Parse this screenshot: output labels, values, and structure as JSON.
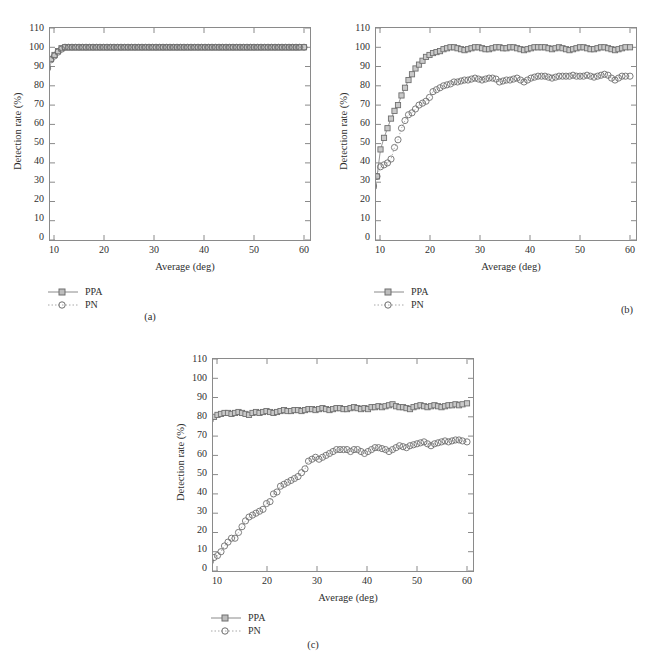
{
  "figure": {
    "background": "#ffffff",
    "line_color": "#8a8a8a",
    "text_color": "#2f2f2f"
  },
  "panels": [
    {
      "id": "a",
      "caption": "(a)",
      "axis": {
        "xlabel": "Average (deg)",
        "ylabel": "Detection rate (%)",
        "xticks": [
          "10",
          "20",
          "30",
          "40",
          "50",
          "60"
        ],
        "yticks": [
          "0",
          "10",
          "20",
          "30",
          "40",
          "50",
          "60",
          "70",
          "80",
          "90",
          "100",
          "110"
        ]
      },
      "legend": [
        {
          "label": "PPA",
          "marker": "square",
          "line": "solid"
        },
        {
          "label": "PN",
          "marker": "circle",
          "line": "dotted"
        }
      ]
    },
    {
      "id": "b",
      "caption": "(b)",
      "axis": {
        "xlabel": "Average (deg)",
        "ylabel": "Detection rate (%)",
        "xticks": [
          "10",
          "20",
          "30",
          "40",
          "50",
          "60"
        ],
        "yticks": [
          "0",
          "10",
          "20",
          "30",
          "40",
          "50",
          "60",
          "70",
          "80",
          "90",
          "100",
          "110"
        ]
      },
      "legend": [
        {
          "label": "PPA",
          "marker": "square",
          "line": "solid"
        },
        {
          "label": "PN",
          "marker": "circle",
          "line": "dotted"
        }
      ]
    },
    {
      "id": "c",
      "caption": "(c)",
      "axis": {
        "xlabel": "Average (deg)",
        "ylabel": "Detection rate (%)",
        "xticks": [
          "10",
          "20",
          "30",
          "40",
          "50",
          "60"
        ],
        "yticks": [
          "0",
          "10",
          "20",
          "30",
          "40",
          "50",
          "60",
          "70",
          "80",
          "90",
          "100",
          "110"
        ]
      },
      "legend": [
        {
          "label": "PPA",
          "marker": "square",
          "line": "solid"
        },
        {
          "label": "PN",
          "marker": "circle",
          "line": "dotted"
        }
      ]
    }
  ],
  "chart_data": [
    {
      "type": "line",
      "panel": "(a)",
      "title": "",
      "xlabel": "Average (deg)",
      "ylabel": "Detection rate (%)",
      "xlim": [
        8,
        60
      ],
      "ylim": [
        0,
        110
      ],
      "ytick_step": 10,
      "xtick_step": 10,
      "grid": false,
      "legend_position": "below-left",
      "x": [
        8,
        8.7,
        9.4,
        10.1,
        10.8,
        11.5,
        12.2,
        12.9,
        13.6,
        14.3,
        15,
        15.7,
        16.4,
        17.1,
        17.8,
        18.5,
        19.2,
        19.9,
        20.6,
        21.3,
        22,
        22.7,
        23.4,
        24.1,
        24.8,
        25.5,
        26.2,
        26.9,
        27.6,
        28.3,
        29,
        29.7,
        30.4,
        31.1,
        31.8,
        32.5,
        33.2,
        33.9,
        34.6,
        35.3,
        36,
        36.7,
        37.4,
        38.1,
        38.8,
        39.5,
        40.2,
        40.9,
        41.6,
        42.3,
        43,
        43.7,
        44.4,
        45.1,
        45.8,
        46.5,
        47.2,
        47.9,
        48.6,
        49.3,
        50,
        50.7,
        51.4,
        52.1,
        52.8,
        53.5,
        54.2,
        54.9,
        55.6,
        56.3,
        57,
        57.7,
        58.4,
        59.1,
        60
      ],
      "series": [
        {
          "name": "PPA",
          "marker": "square",
          "line": "solid",
          "values": [
            84,
            90,
            94,
            96,
            98,
            99.5,
            100,
            100,
            100,
            100,
            100,
            100,
            100,
            100,
            100,
            100,
            100,
            100,
            100,
            100,
            100,
            100,
            100,
            100,
            100,
            100,
            100,
            100,
            100,
            100,
            100,
            100,
            100,
            100,
            100,
            100,
            100,
            100,
            100,
            100,
            100,
            100,
            100,
            100,
            100,
            100,
            100,
            100,
            100,
            100,
            100,
            100,
            100,
            100,
            100,
            100,
            100,
            100,
            100,
            100,
            100,
            100,
            100,
            100,
            100,
            100,
            100,
            100,
            100,
            100,
            100,
            100,
            100,
            100,
            100
          ]
        },
        {
          "name": "PN",
          "marker": "circle",
          "line": "dotted",
          "values": [
            78,
            89,
            93.5,
            95.5,
            97.5,
            99,
            100,
            100,
            100,
            100,
            100,
            100,
            100,
            100,
            100,
            100,
            100,
            100,
            100,
            100,
            100,
            100,
            100,
            100,
            100,
            100,
            100,
            100,
            100,
            100,
            100,
            100,
            100,
            100,
            100,
            100,
            100,
            100,
            100,
            100,
            100,
            100,
            100,
            100,
            100,
            100,
            100,
            100,
            100,
            100,
            100,
            100,
            100,
            100,
            100,
            100,
            100,
            100,
            100,
            100,
            100,
            100,
            100,
            100,
            100,
            100,
            100,
            100,
            100,
            100,
            100,
            100,
            100,
            100,
            100
          ]
        }
      ]
    },
    {
      "type": "line",
      "panel": "(b)",
      "title": "",
      "xlabel": "Average (deg)",
      "ylabel": "Detection rate (%)",
      "xlim": [
        8,
        60
      ],
      "ylim": [
        0,
        110
      ],
      "ytick_step": 10,
      "xtick_step": 10,
      "grid": false,
      "legend_position": "below-left",
      "x": [
        8,
        8.7,
        9.4,
        10.1,
        10.8,
        11.5,
        12.2,
        12.9,
        13.6,
        14.3,
        15,
        15.7,
        16.4,
        17.1,
        17.8,
        18.5,
        19.2,
        19.9,
        20.6,
        21.3,
        22,
        22.7,
        23.4,
        24.1,
        24.8,
        25.5,
        26.2,
        26.9,
        27.6,
        28.3,
        29,
        29.7,
        30.4,
        31.1,
        31.8,
        32.5,
        33.2,
        33.9,
        34.6,
        35.3,
        36,
        36.7,
        37.4,
        38.1,
        38.8,
        39.5,
        40.2,
        40.9,
        41.6,
        42.3,
        43,
        43.7,
        44.4,
        45.1,
        45.8,
        46.5,
        47.2,
        47.9,
        48.6,
        49.3,
        50,
        50.7,
        51.4,
        52.1,
        52.8,
        53.5,
        54.2,
        54.9,
        55.6,
        56.3,
        57,
        57.7,
        58.4,
        59.1,
        60
      ],
      "series": [
        {
          "name": "PPA",
          "marker": "square",
          "line": "solid",
          "values": [
            23,
            28,
            33,
            47,
            53,
            58,
            63,
            67,
            70,
            75,
            79,
            83,
            86,
            89,
            91,
            93,
            95,
            96,
            97,
            97.5,
            98,
            99,
            99.5,
            100,
            100,
            99.5,
            99,
            98.5,
            99,
            99.5,
            100,
            100,
            99.5,
            99,
            99,
            99.5,
            100,
            100,
            99.5,
            99.5,
            100,
            100,
            99.5,
            99,
            98.5,
            99,
            99.5,
            100,
            100,
            100,
            100,
            99.5,
            99,
            99.5,
            100,
            99.5,
            99,
            98.5,
            99,
            99.5,
            100,
            100,
            99.5,
            99,
            99,
            99.5,
            100,
            100,
            99.5,
            99,
            98.5,
            99,
            99.5,
            100,
            100
          ]
        },
        {
          "name": "PN",
          "marker": "circle",
          "line": "dotted",
          "values": [
            23,
            28,
            33,
            38,
            39,
            40,
            42,
            48,
            52,
            58,
            62,
            65,
            66,
            68,
            70,
            71,
            72,
            74,
            77,
            78,
            79,
            80,
            80.5,
            81,
            82,
            82,
            82.5,
            83,
            83,
            83.5,
            84,
            83.5,
            83,
            83.5,
            84,
            84,
            83.5,
            82,
            82.5,
            83,
            83,
            83.5,
            84,
            83,
            82,
            83,
            84,
            84.5,
            85,
            85,
            85,
            84.5,
            84,
            84.5,
            85,
            85,
            85,
            85,
            85.5,
            85,
            85,
            85,
            85.5,
            85,
            84.5,
            85,
            85.5,
            86,
            85.5,
            84,
            83,
            84,
            85,
            85,
            85
          ]
        }
      ]
    },
    {
      "type": "line",
      "panel": "(c)",
      "title": "",
      "xlabel": "Average (deg)",
      "ylabel": "Detection rate (%)",
      "xlim": [
        8,
        60
      ],
      "ylim": [
        0,
        110
      ],
      "ytick_step": 10,
      "xtick_step": 10,
      "grid": false,
      "legend_position": "below-left",
      "x": [
        8,
        8.7,
        9.4,
        10.1,
        10.8,
        11.5,
        12.2,
        12.9,
        13.6,
        14.3,
        15,
        15.7,
        16.4,
        17.1,
        17.8,
        18.5,
        19.2,
        19.9,
        20.6,
        21.3,
        22,
        22.7,
        23.4,
        24.1,
        24.8,
        25.5,
        26.2,
        26.9,
        27.6,
        28.3,
        29,
        29.7,
        30.4,
        31.1,
        31.8,
        32.5,
        33.2,
        33.9,
        34.6,
        35.3,
        36,
        36.7,
        37.4,
        38.1,
        38.8,
        39.5,
        40.2,
        40.9,
        41.6,
        42.3,
        43,
        43.7,
        44.4,
        45.1,
        45.8,
        46.5,
        47.2,
        47.9,
        48.6,
        49.3,
        50,
        50.7,
        51.4,
        52.1,
        52.8,
        53.5,
        54.2,
        54.9,
        55.6,
        56.3,
        57,
        57.7,
        58.4,
        59.1,
        60
      ],
      "series": [
        {
          "name": "PPA",
          "marker": "square",
          "line": "solid",
          "values": [
            78,
            79,
            80,
            81,
            81.5,
            82,
            82,
            81.5,
            82,
            82.5,
            82,
            81.5,
            81,
            82,
            82.5,
            82,
            82.5,
            83,
            82.5,
            82,
            82.5,
            83,
            83.5,
            83,
            83,
            83.5,
            83.5,
            83,
            83.5,
            84,
            84,
            83.5,
            84,
            84.5,
            84,
            83.5,
            84,
            84.5,
            84.5,
            84,
            84,
            84.5,
            85,
            84.5,
            84,
            84.5,
            84,
            85,
            85,
            85.5,
            85,
            85.5,
            86,
            86.5,
            85.5,
            85,
            85,
            84.5,
            84,
            85,
            85.5,
            86,
            85.5,
            85,
            85.5,
            86,
            85.5,
            85,
            85.5,
            86,
            86,
            86.5,
            86,
            86.5,
            87
          ]
        },
        {
          "name": "PN",
          "marker": "circle",
          "line": "dotted",
          "values": [
            4,
            5,
            7,
            8,
            10,
            13,
            15,
            17,
            17,
            20,
            23,
            26,
            28,
            29,
            30,
            31,
            32,
            35,
            36,
            40,
            41,
            44,
            45,
            46,
            47,
            48,
            49,
            51,
            53,
            57,
            58,
            59,
            58,
            59,
            60,
            61,
            62,
            63,
            63,
            63,
            63,
            62,
            63,
            63,
            62,
            61,
            62,
            63,
            64,
            64,
            63.5,
            63,
            62,
            63,
            64,
            65,
            64.5,
            64,
            65,
            65.5,
            66,
            66.5,
            67,
            66,
            65,
            66,
            66.5,
            67,
            67.5,
            67,
            67.5,
            68,
            68,
            67.5,
            67
          ]
        }
      ]
    }
  ]
}
